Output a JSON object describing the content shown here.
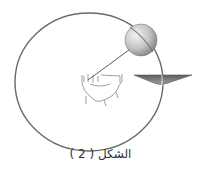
{
  "figure": {
    "caption": "الشكل ( 2 )",
    "colors": {
      "orbit": "#6a6a6a",
      "sphere_light": "#e8e8e8",
      "sphere_dark": "#8c8c8c",
      "string": "#4a4a4a",
      "funnel": "#7a7a7a",
      "background": "#ffffff"
    }
  }
}
